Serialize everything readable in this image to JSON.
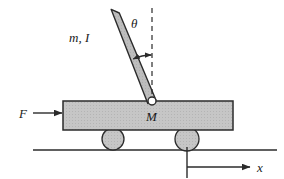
{
  "figure": {
    "background": "#ffffff"
  },
  "labels": {
    "theta": "θ",
    "pendulum": "m, I",
    "cart": "M",
    "force": "F",
    "axis": "x"
  },
  "colors": {
    "body_fill": "#c6c6c6",
    "body_stroke": "#2b2b2b",
    "rod_fill": "#bdbdbd",
    "wheel_fill": "#c0c0c0",
    "line": "#2b2b2b",
    "pivot_fill": "#ffffff"
  },
  "geometry": {
    "cart": {
      "x": 63,
      "y": 101,
      "width": 170,
      "height": 29
    },
    "rod": {
      "top_x": 115,
      "top_y": 12,
      "pivot_x": 152,
      "pivot_y": 101,
      "thickness": 8
    },
    "pivot": {
      "cx": 152,
      "cy": 101,
      "r": 4
    },
    "wheels": [
      {
        "cx": 113,
        "cy": 139,
        "r": 11
      },
      {
        "cx": 187,
        "cy": 139,
        "r": 12
      }
    ],
    "ground": {
      "x1": 33,
      "y1": 150,
      "x2": 277,
      "y2": 150
    },
    "dashed_vertical": {
      "x": 152,
      "y1": 8,
      "y2": 100
    },
    "angle_arc": {
      "cx": 152,
      "cy": 101,
      "radius": 46
    },
    "force_arrow": {
      "x1": 33,
      "y1": 113,
      "x2": 62,
      "y2": 113
    },
    "axis_arrow": {
      "x1": 187,
      "y1": 167,
      "x2": 250,
      "y2": 167
    },
    "axis_tick": {
      "x": 187,
      "y1": 147,
      "y2": 178
    }
  }
}
